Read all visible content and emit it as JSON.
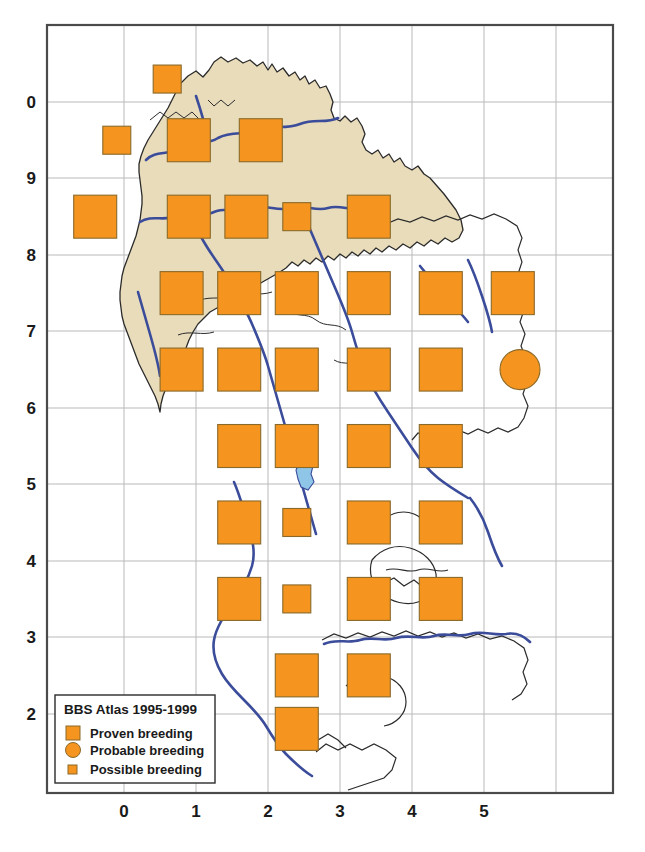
{
  "figure": {
    "type": "distribution-map",
    "title": "BBS Atlas 1995-1999",
    "colors": {
      "symbol_fill": "#F5941E",
      "symbol_stroke": "#8a6a2a",
      "land": "#E9DCBB",
      "river": "#3A4C9A",
      "lake": "#8FC6E8",
      "border": "#3a3a3a",
      "grid": "#b9b9b9",
      "frame": "#4a4a4a",
      "background": "#FFFFFF"
    }
  },
  "legend": {
    "title": "BBS Atlas 1995-1999",
    "items": [
      {
        "label": "Proven breeding",
        "symbol": "large-square"
      },
      {
        "label": "Probable breeding",
        "symbol": "circle"
      },
      {
        "label": "Possible breeding",
        "symbol": "small-square"
      }
    ]
  },
  "axes": {
    "x": {
      "ticks": [
        "0",
        "1",
        "2",
        "3",
        "4",
        "5"
      ],
      "range": [
        -0.6,
        5.9
      ]
    },
    "y": {
      "ticks": [
        "0",
        "9",
        "8",
        "7",
        "6",
        "5",
        "4",
        "3",
        "2"
      ],
      "range": [
        1.55,
        10.35
      ]
    }
  },
  "chart_data": {
    "type": "scatter",
    "title": "BBS Atlas 1995-1999",
    "xlabel": "",
    "ylabel": "",
    "xlim": [
      -0.6,
      5.9
    ],
    "ylim": [
      1.55,
      10.35
    ],
    "grid": true,
    "legend_position": "bottom-left",
    "categories": [
      "Proven breeding",
      "Probable breeding",
      "Possible breeding"
    ],
    "points": [
      {
        "x": 0.6,
        "y": 10.3,
        "class": "Possible breeding"
      },
      {
        "x": -0.1,
        "y": 9.5,
        "class": "Possible breeding"
      },
      {
        "x": 0.9,
        "y": 9.5,
        "class": "Proven breeding"
      },
      {
        "x": 1.9,
        "y": 9.5,
        "class": "Proven breeding"
      },
      {
        "x": -0.4,
        "y": 8.5,
        "class": "Proven breeding"
      },
      {
        "x": 0.9,
        "y": 8.5,
        "class": "Proven breeding"
      },
      {
        "x": 1.7,
        "y": 8.5,
        "class": "Proven breeding"
      },
      {
        "x": 2.4,
        "y": 8.5,
        "class": "Possible breeding"
      },
      {
        "x": 3.4,
        "y": 8.5,
        "class": "Proven breeding"
      },
      {
        "x": 0.8,
        "y": 7.5,
        "class": "Proven breeding"
      },
      {
        "x": 1.6,
        "y": 7.5,
        "class": "Proven breeding"
      },
      {
        "x": 2.4,
        "y": 7.5,
        "class": "Proven breeding"
      },
      {
        "x": 3.4,
        "y": 7.5,
        "class": "Proven breeding"
      },
      {
        "x": 4.4,
        "y": 7.5,
        "class": "Proven breeding"
      },
      {
        "x": 5.4,
        "y": 7.5,
        "class": "Proven breeding"
      },
      {
        "x": 0.8,
        "y": 6.5,
        "class": "Proven breeding"
      },
      {
        "x": 1.6,
        "y": 6.5,
        "class": "Proven breeding"
      },
      {
        "x": 2.4,
        "y": 6.5,
        "class": "Proven breeding"
      },
      {
        "x": 3.4,
        "y": 6.5,
        "class": "Proven breeding"
      },
      {
        "x": 4.4,
        "y": 6.5,
        "class": "Proven breeding"
      },
      {
        "x": 5.5,
        "y": 6.5,
        "class": "Probable breeding"
      },
      {
        "x": 1.6,
        "y": 5.5,
        "class": "Proven breeding"
      },
      {
        "x": 2.4,
        "y": 5.5,
        "class": "Proven breeding"
      },
      {
        "x": 3.4,
        "y": 5.5,
        "class": "Proven breeding"
      },
      {
        "x": 4.4,
        "y": 5.5,
        "class": "Proven breeding"
      },
      {
        "x": 1.6,
        "y": 4.5,
        "class": "Proven breeding"
      },
      {
        "x": 2.4,
        "y": 4.5,
        "class": "Possible breeding"
      },
      {
        "x": 3.4,
        "y": 4.5,
        "class": "Proven breeding"
      },
      {
        "x": 4.4,
        "y": 4.5,
        "class": "Proven breeding"
      },
      {
        "x": 1.6,
        "y": 3.5,
        "class": "Proven breeding"
      },
      {
        "x": 2.4,
        "y": 3.5,
        "class": "Possible breeding"
      },
      {
        "x": 3.4,
        "y": 3.5,
        "class": "Proven breeding"
      },
      {
        "x": 4.4,
        "y": 3.5,
        "class": "Proven breeding"
      },
      {
        "x": 2.4,
        "y": 2.5,
        "class": "Proven breeding"
      },
      {
        "x": 3.4,
        "y": 2.5,
        "class": "Proven breeding"
      },
      {
        "x": 2.4,
        "y": 1.8,
        "class": "Proven breeding"
      }
    ]
  }
}
